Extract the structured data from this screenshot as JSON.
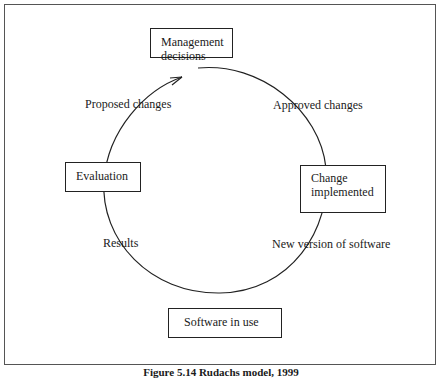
{
  "diagram": {
    "nodes": {
      "top": "Management decisions",
      "left": "Evaluation",
      "right_line1": "Change",
      "right_line2": "implemented",
      "bottom": "Software in use"
    },
    "edge_labels": {
      "proposed": "Proposed changes",
      "approved": "Approved changes",
      "results": "Results",
      "new_version": "New version of software"
    },
    "caption": "Figure 5.14 Rudachs model, 1999"
  }
}
